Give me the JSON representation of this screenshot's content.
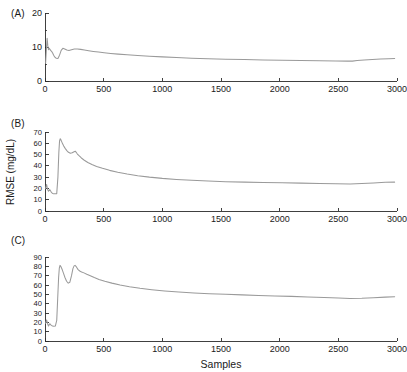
{
  "figure": {
    "background": "#ffffff",
    "line_color": "#9a9a9a",
    "axis_color": "#2b2b2b",
    "xlabel": "Samples",
    "ylabel": "RMSE (mg/dL)",
    "panel_labels": {
      "a": "(A)",
      "b": "(B)",
      "c": "(C)"
    }
  },
  "axis": {
    "x_ticks": [
      "0",
      "500",
      "1000",
      "1500",
      "2000",
      "2500",
      "3000"
    ],
    "y_ticks_a": [
      "0",
      "10",
      "20"
    ],
    "y_ticks_b": [
      "0",
      "10",
      "20",
      "30",
      "40",
      "50",
      "60",
      "70"
    ],
    "y_ticks_c": [
      "0",
      "10",
      "20",
      "30",
      "40",
      "50",
      "60",
      "70",
      "80",
      "90"
    ]
  },
  "chart_data": [
    {
      "type": "line",
      "panel": "(A)",
      "title": "(A)",
      "xlabel": "",
      "ylabel": "RMSE (mg/dL)",
      "xlim": [
        0,
        3000
      ],
      "ylim": [
        0,
        20
      ],
      "xticks": [
        0,
        500,
        1000,
        1500,
        2000,
        2500,
        3000
      ],
      "yticks": [
        0,
        10,
        20
      ],
      "grid": false,
      "legend": null,
      "series": [
        {
          "name": "RMSE",
          "x": [
            5,
            12,
            18,
            24,
            30,
            36,
            42,
            48,
            56,
            64,
            74,
            84,
            96,
            110,
            124,
            138,
            152,
            168,
            186,
            204,
            226,
            250,
            276,
            304,
            336,
            372,
            412,
            456,
            504,
            560,
            624,
            700,
            790,
            890,
            1000,
            1120,
            1250,
            1390,
            1540,
            1700,
            1860,
            2020,
            2180,
            2340,
            2480,
            2580,
            2620,
            2660,
            2720,
            2790,
            2860,
            2930,
            2980
          ],
          "y": [
            5.2,
            9.4,
            12.6,
            10.4,
            9.2,
            9.6,
            9.3,
            9.0,
            8.7,
            8.3,
            7.6,
            7.0,
            6.7,
            6.6,
            7.6,
            9.0,
            9.6,
            9.4,
            9.1,
            9.0,
            9.2,
            9.4,
            9.4,
            9.3,
            9.1,
            8.9,
            8.7,
            8.5,
            8.3,
            8.1,
            7.9,
            7.7,
            7.5,
            7.3,
            7.1,
            6.9,
            6.7,
            6.55,
            6.4,
            6.3,
            6.2,
            6.1,
            6.0,
            5.95,
            5.9,
            5.85,
            5.85,
            6.05,
            6.2,
            6.35,
            6.45,
            6.55,
            6.6
          ]
        }
      ]
    },
    {
      "type": "line",
      "panel": "(B)",
      "title": "(B)",
      "xlabel": "",
      "ylabel": "RMSE (mg/dL)",
      "xlim": [
        0,
        3000
      ],
      "ylim": [
        0,
        70
      ],
      "xticks": [
        0,
        500,
        1000,
        1500,
        2000,
        2500,
        3000
      ],
      "yticks": [
        0,
        10,
        20,
        30,
        40,
        50,
        60,
        70
      ],
      "grid": false,
      "legend": null,
      "series": [
        {
          "name": "RMSE",
          "x": [
            5,
            14,
            22,
            30,
            40,
            52,
            64,
            76,
            88,
            100,
            110,
            118,
            124,
            130,
            136,
            142,
            150,
            160,
            172,
            186,
            200,
            216,
            232,
            248,
            258,
            266,
            276,
            290,
            310,
            335,
            365,
            400,
            440,
            490,
            550,
            620,
            700,
            790,
            890,
            1000,
            1120,
            1250,
            1390,
            1540,
            1700,
            1860,
            2020,
            2180,
            2340,
            2480,
            2600,
            2700,
            2800,
            2900,
            2980
          ],
          "y": [
            20.0,
            23.5,
            19.0,
            17.5,
            19.0,
            17.0,
            15.5,
            15.2,
            15.3,
            15.4,
            30.0,
            52.0,
            62.0,
            64.0,
            63.0,
            61.5,
            59.5,
            57.5,
            55.5,
            53.5,
            52.0,
            51.2,
            51.6,
            52.5,
            53.0,
            52.0,
            50.5,
            49.0,
            47.0,
            45.0,
            43.0,
            41.2,
            39.5,
            37.8,
            36.0,
            34.3,
            32.7,
            31.3,
            30.0,
            28.9,
            28.0,
            27.2,
            26.5,
            26.0,
            25.6,
            25.3,
            25.0,
            24.7,
            24.4,
            24.1,
            23.9,
            24.4,
            24.9,
            25.4,
            25.6
          ]
        }
      ]
    },
    {
      "type": "line",
      "panel": "(C)",
      "title": "(C)",
      "xlabel": "Samples",
      "ylabel": "RMSE (mg/dL)",
      "xlim": [
        0,
        3000
      ],
      "ylim": [
        0,
        90
      ],
      "xticks": [
        0,
        500,
        1000,
        1500,
        2000,
        2500,
        3000
      ],
      "yticks": [
        0,
        10,
        20,
        30,
        40,
        50,
        60,
        70,
        80,
        90
      ],
      "grid": false,
      "legend": null,
      "series": [
        {
          "name": "RMSE",
          "x": [
            5,
            14,
            22,
            30,
            40,
            52,
            64,
            76,
            88,
            100,
            108,
            116,
            122,
            128,
            134,
            140,
            148,
            158,
            170,
            184,
            198,
            212,
            226,
            238,
            248,
            256,
            264,
            272,
            282,
            296,
            312,
            332,
            356,
            386,
            420,
            460,
            510,
            570,
            640,
            720,
            810,
            910,
            1020,
            1140,
            1270,
            1400,
            1540,
            1680,
            1820,
            1960,
            2100,
            2240,
            2380,
            2500,
            2600,
            2700,
            2800,
            2900,
            2980
          ],
          "y": [
            19.0,
            22.5,
            18.5,
            16.0,
            18.5,
            17.0,
            16.0,
            15.8,
            16.0,
            22.0,
            45.0,
            68.0,
            78.0,
            81.0,
            80.0,
            78.5,
            76.0,
            72.5,
            68.0,
            64.0,
            62.0,
            63.0,
            70.0,
            77.5,
            80.5,
            81.0,
            80.0,
            78.5,
            76.5,
            75.0,
            74.0,
            73.0,
            71.5,
            70.0,
            68.0,
            66.0,
            64.0,
            62.0,
            60.0,
            58.2,
            56.5,
            55.0,
            53.6,
            52.4,
            51.4,
            50.6,
            50.0,
            49.4,
            48.8,
            48.3,
            47.8,
            47.2,
            46.6,
            46.0,
            45.6,
            45.8,
            46.3,
            47.0,
            47.4
          ]
        }
      ]
    }
  ]
}
